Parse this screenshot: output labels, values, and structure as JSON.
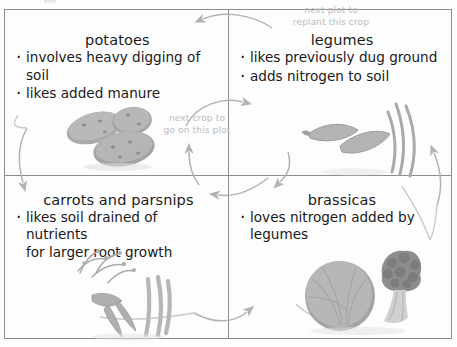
{
  "diagram": {
    "frame_color": "#8a8d8f",
    "note_color": "#b9bcbe",
    "text_color": "#191919"
  },
  "quadrants": [
    {
      "id": "potatoes",
      "title": "potatoes",
      "bullets": [
        "involves heavy digging of soil",
        "likes added manure"
      ],
      "illustration": "potatoes-illustration"
    },
    {
      "id": "legumes",
      "title": "legumes",
      "bullets": [
        "likes previously dug ground",
        "adds nitrogen to soil"
      ],
      "illustration": "pea-pods-illustration"
    },
    {
      "id": "carrots-and-parsnips",
      "title": "carrots and parsnips",
      "bullets": [
        "likes soil drained of nutrients\nfor larger root growth"
      ],
      "illustration": "carrots-parsnips-illustration"
    },
    {
      "id": "brassicas",
      "title": "brassicas",
      "bullets": [
        "loves nitrogen added by\nlegumes"
      ],
      "illustration": "cabbage-broccoli-illustration"
    }
  ],
  "notes": [
    {
      "id": "next-plot-note",
      "text": "next plot to\nreplant this crop"
    },
    {
      "id": "next-crop-note",
      "text": "next crop to\ngo on this plot"
    }
  ]
}
